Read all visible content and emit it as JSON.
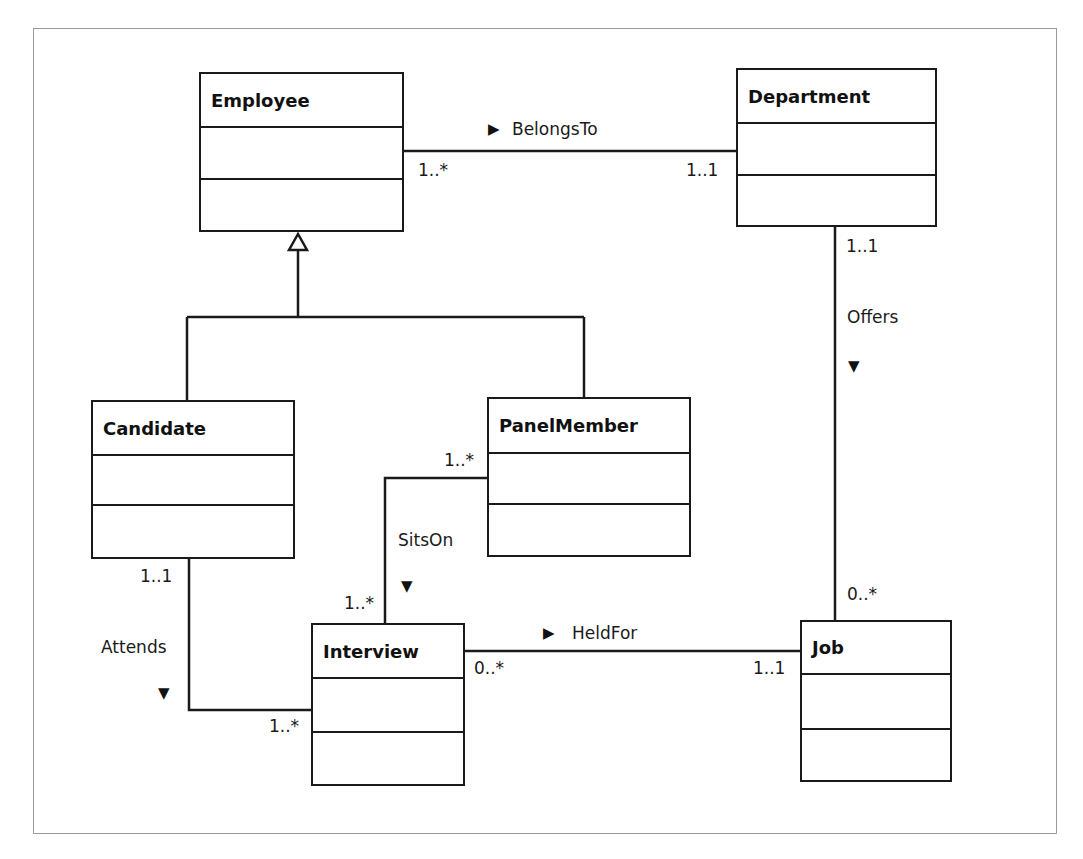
{
  "diagram": {
    "type": "UML class diagram",
    "classes": [
      {
        "id": "employee",
        "name": "Employee"
      },
      {
        "id": "department",
        "name": "Department"
      },
      {
        "id": "candidate",
        "name": "Candidate"
      },
      {
        "id": "panelmember",
        "name": "PanelMember"
      },
      {
        "id": "interview",
        "name": "Interview"
      },
      {
        "id": "job",
        "name": "Job"
      }
    ],
    "generalizations": [
      {
        "parent": "Employee",
        "children": [
          "Candidate",
          "PanelMember"
        ]
      }
    ],
    "associations": [
      {
        "name": "BelongsTo",
        "direction_arrow": "▶",
        "from": "Employee",
        "from_mult": "1..*",
        "to": "Department",
        "to_mult": "1..1"
      },
      {
        "name": "Offers",
        "direction_arrow": "▼",
        "from": "Department",
        "from_mult": "1..1",
        "to": "Job",
        "to_mult": "0..*"
      },
      {
        "name": "SitsOn",
        "direction_arrow": "▼",
        "from": "PanelMember",
        "from_mult": "1..*",
        "to": "Interview",
        "to_mult": "1..*"
      },
      {
        "name": "Attends",
        "direction_arrow": "▼",
        "from": "Candidate",
        "from_mult": "1..1",
        "to": "Interview",
        "to_mult": "1..*"
      },
      {
        "name": "HeldFor",
        "direction_arrow": "▶",
        "from": "Interview",
        "from_mult": "0..*",
        "to": "Job",
        "to_mult": "1..1"
      }
    ]
  },
  "colors": {
    "line": "#1a1a1a",
    "frame": "#9a9a9a",
    "background": "#ffffff"
  }
}
